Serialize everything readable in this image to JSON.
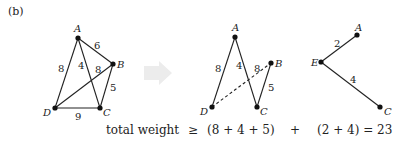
{
  "panel_label": "(b)",
  "colors": {
    "ink": "#222222",
    "arrow": "#ececec"
  },
  "graph1": {
    "nodes": {
      "A": {
        "label": "A",
        "x": 78,
        "y": 38
      },
      "B": {
        "label": "B",
        "x": 113,
        "y": 64
      },
      "C": {
        "label": "C",
        "x": 100,
        "y": 108
      },
      "D": {
        "label": "D",
        "x": 55,
        "y": 108
      }
    },
    "edges": [
      {
        "from": "A",
        "to": "B",
        "weight": "6"
      },
      {
        "from": "A",
        "to": "D",
        "weight": "8"
      },
      {
        "from": "A",
        "to": "C",
        "weight": "4"
      },
      {
        "from": "D",
        "to": "B",
        "weight": "8"
      },
      {
        "from": "B",
        "to": "C",
        "weight": "5"
      },
      {
        "from": "D",
        "to": "C",
        "weight": "9"
      }
    ]
  },
  "graph2": {
    "nodes": {
      "A": {
        "label": "A",
        "x": 235,
        "y": 37
      },
      "B": {
        "label": "B",
        "x": 271,
        "y": 63
      },
      "C": {
        "label": "C",
        "x": 257,
        "y": 107
      },
      "D": {
        "label": "D",
        "x": 212,
        "y": 107
      }
    },
    "edges": [
      {
        "from": "A",
        "to": "D",
        "weight": "8",
        "style": "solid"
      },
      {
        "from": "A",
        "to": "C",
        "weight": "4",
        "style": "solid"
      },
      {
        "from": "B",
        "to": "C",
        "weight": "5",
        "style": "solid"
      },
      {
        "from": "D",
        "to": "B",
        "weight": "8",
        "style": "dashed"
      }
    ]
  },
  "graph3": {
    "nodes": {
      "A": {
        "label": "A",
        "x": 357,
        "y": 35
      },
      "E": {
        "label": "E",
        "x": 321,
        "y": 62
      },
      "C": {
        "label": "C",
        "x": 380,
        "y": 107
      }
    },
    "edges": [
      {
        "from": "E",
        "to": "A",
        "weight": "2"
      },
      {
        "from": "E",
        "to": "C",
        "weight": "4"
      }
    ]
  },
  "equation": {
    "lhs": "total weight",
    "relation": "≥",
    "term1": "(8 + 4 + 5)",
    "plus": "+",
    "term2": "(2 + 4) = 23"
  }
}
